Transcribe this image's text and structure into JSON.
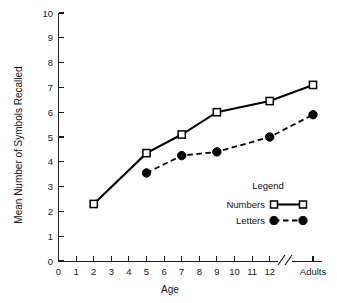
{
  "chart_data": {
    "type": "line",
    "title": "",
    "xlabel": "Age",
    "ylabel": "Mean Number of Symbols Recalled",
    "ylim": [
      0,
      10
    ],
    "y_ticks": [
      0,
      1,
      2,
      3,
      4,
      5,
      6,
      7,
      8,
      9,
      10
    ],
    "x_ticks": [
      "0",
      "1",
      "2",
      "3",
      "4",
      "5",
      "6",
      "7",
      "8",
      "9",
      "10",
      "11",
      "12",
      "Adults"
    ],
    "x_axis_break": true,
    "x_axis_break_symbol": "//",
    "grid": false,
    "legend_position": "lower-right-inside",
    "legend_title": "Legend",
    "categories": [
      "2",
      "5",
      "7",
      "9",
      "12",
      "Adults"
    ],
    "series": [
      {
        "name": "Numbers",
        "marker": "open-square",
        "linestyle": "solid",
        "color": "#000000",
        "x": [
          "2",
          "5",
          "7",
          "9",
          "12",
          "Adults"
        ],
        "values": [
          2.3,
          4.35,
          5.1,
          6.0,
          6.45,
          7.1
        ]
      },
      {
        "name": "Letters",
        "marker": "filled-circle",
        "linestyle": "dashed",
        "color": "#000000",
        "x": [
          "5",
          "7",
          "9",
          "12",
          "Adults"
        ],
        "values": [
          3.55,
          4.25,
          4.4,
          5.0,
          5.9
        ]
      }
    ]
  },
  "axes": {
    "y_title": "Mean Number of Symbols Recalled",
    "x_title": "Age",
    "y_tick_labels": [
      "10",
      "9",
      "8",
      "7",
      "6",
      "5",
      "4",
      "3",
      "2",
      "1",
      "0"
    ],
    "x_tick_labels": [
      "0",
      "1",
      "2",
      "3",
      "4",
      "5",
      "6",
      "7",
      "8",
      "9",
      "10",
      "11",
      "12",
      "Adults"
    ],
    "break_symbol": "//"
  },
  "legend": {
    "title": "Legend",
    "entries": [
      {
        "label": "Numbers",
        "marker": "open-square",
        "linestyle": "solid"
      },
      {
        "label": "Letters",
        "marker": "filled-circle",
        "linestyle": "dashed"
      }
    ]
  },
  "colors": {
    "background": "#ffffff",
    "ink": "#000000",
    "axis": "#1a1a1a"
  }
}
